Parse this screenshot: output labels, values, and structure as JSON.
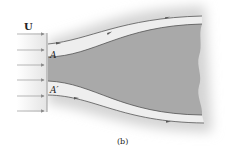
{
  "figure": {
    "velocity_label": "U",
    "point_upper_label": "A",
    "point_lower_label": "A′",
    "caption": "(b)"
  },
  "colors": {
    "body_fill": "#a9a9a9",
    "halo": "#d8d8d8",
    "streamline": "#555555",
    "arrow": "#8a8a8a",
    "stream_tube": "#ececec"
  },
  "uniform_flow_arrows": {
    "count": 6
  },
  "streamlines": [
    {
      "name": "upper-streamline",
      "arrows": 3
    },
    {
      "name": "lower-streamline",
      "arrows": 2
    }
  ]
}
